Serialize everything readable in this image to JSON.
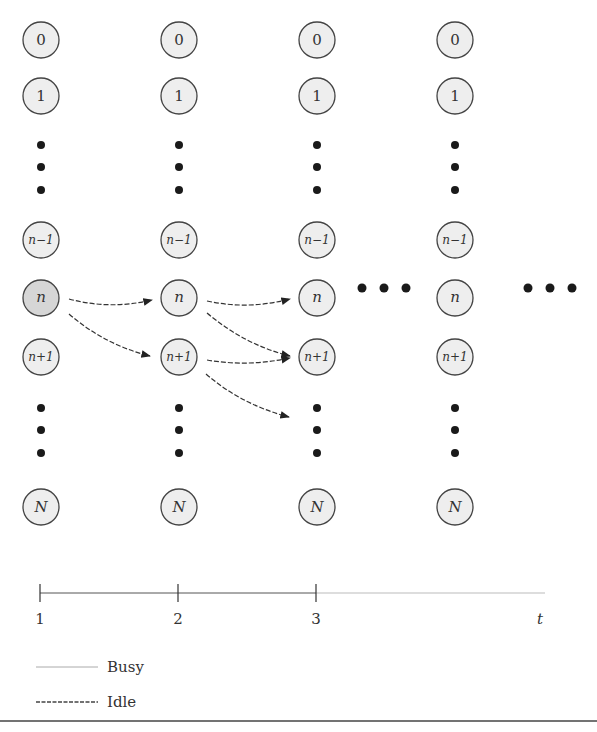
{
  "diagram": {
    "columns": [
      {
        "x": 41,
        "time": "1"
      },
      {
        "x": 179,
        "time": "2"
      },
      {
        "x": 317,
        "time": "3"
      },
      {
        "x": 455,
        "time": ""
      }
    ],
    "states": [
      {
        "label": "0",
        "y": 40,
        "style": "normal"
      },
      {
        "label": "1",
        "y": 96,
        "style": "normal"
      },
      {
        "label": "n",
        "y": 298,
        "style": "italic"
      },
      {
        "label": "n−1",
        "y": 240,
        "style": "italic-small"
      },
      {
        "label": "n+1",
        "y": 357,
        "style": "italic-small"
      },
      {
        "label": "N",
        "y": 507,
        "style": "italic"
      }
    ],
    "node_labels": {
      "zero": "0",
      "one": "1",
      "n_minus_1": "n−1",
      "n": "n",
      "n_plus_1": "n+1",
      "N": "N"
    },
    "highlighted_node": {
      "column": 1,
      "state": "n",
      "color": "#d6d6d6"
    },
    "node_fill": "#eeeeee",
    "transitions": [
      {
        "from": "col1:n",
        "to": "col2:n"
      },
      {
        "from": "col1:n",
        "to": "col2:n+1"
      },
      {
        "from": "col2:n",
        "to": "col3:n"
      },
      {
        "from": "col2:n",
        "to": "col3:n+1"
      },
      {
        "from": "col2:n+1",
        "to": "col3:n+1"
      },
      {
        "from": "col2:n+1",
        "to": "col3:below-n+1"
      }
    ],
    "ellipsis": "• • •"
  },
  "timeline": {
    "ticks": [
      "1",
      "2",
      "3"
    ],
    "end_label": "t"
  },
  "legend": {
    "busy": "Busy",
    "idle": "Idle"
  }
}
